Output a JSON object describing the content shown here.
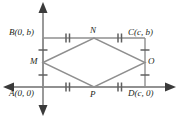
{
  "figure": {
    "type": "geometry-diagram",
    "colors": {
      "line": "#8a8a8a",
      "axis": "#6e6e6e",
      "tick": "#6e6e6e",
      "text": "#231f20",
      "background": "#ffffff"
    },
    "vertices": [
      {
        "name": "A",
        "label": "A(0, 0)",
        "x": 0,
        "y": 0,
        "position": "bottom-left"
      },
      {
        "name": "B",
        "label": "B(0, b)",
        "x": 0,
        "y": "b",
        "position": "top-left"
      },
      {
        "name": "C",
        "label": "C(c, b)",
        "x": "c",
        "y": "b",
        "position": "top-right"
      },
      {
        "name": "D",
        "label": "D(c, 0)",
        "x": "c",
        "y": 0,
        "position": "bottom-right"
      }
    ],
    "midpoints": [
      {
        "name": "M",
        "label": "M",
        "on": "AB",
        "position": "left"
      },
      {
        "name": "N",
        "label": "N",
        "on": "BC",
        "position": "top"
      },
      {
        "name": "O",
        "label": "O",
        "on": "CD",
        "position": "right"
      },
      {
        "name": "P",
        "label": "P",
        "on": "AD",
        "position": "bottom"
      }
    ],
    "rhombus_order": [
      "M",
      "N",
      "O",
      "P"
    ],
    "tick_marks": [
      {
        "segment": "B-N",
        "count": 2
      },
      {
        "segment": "N-C",
        "count": 2
      },
      {
        "segment": "A-P",
        "count": 2
      },
      {
        "segment": "P-D",
        "count": 2
      },
      {
        "segment": "B-M",
        "count": 1
      },
      {
        "segment": "M-A",
        "count": 1
      },
      {
        "segment": "C-O",
        "count": 1
      },
      {
        "segment": "O-D",
        "count": 1
      }
    ],
    "axes": {
      "x_axis": {
        "arrows": [
          "left",
          "right"
        ]
      },
      "y_axis": {
        "arrows": [
          "up",
          "down"
        ]
      }
    }
  }
}
